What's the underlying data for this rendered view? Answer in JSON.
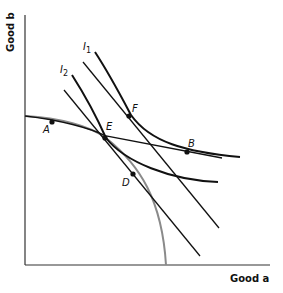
{
  "diagram": {
    "axes": {
      "x_label": "Good a",
      "y_label": "Good b"
    },
    "curves": {
      "indifference_1": {
        "label": "I",
        "subscript": "1"
      },
      "indifference_2": {
        "label": "I",
        "subscript": "2"
      },
      "production_frontier": {
        "color": "#888888"
      }
    },
    "points": {
      "A": "A",
      "B": "B",
      "D": "D",
      "E": "E",
      "F": "F"
    }
  }
}
